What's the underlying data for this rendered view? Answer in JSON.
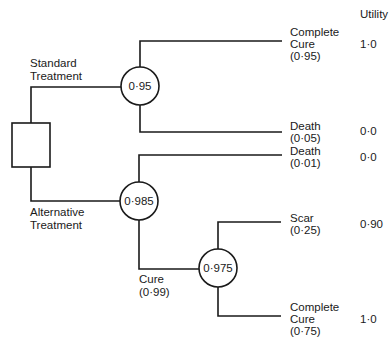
{
  "header": {
    "utility_label": "Utility"
  },
  "decision_node": {
    "label": ""
  },
  "branches": {
    "standard": {
      "line1": "Standard",
      "line2": "Treatment"
    },
    "alternative": {
      "line1": "Alternative",
      "line2": "Treatment"
    }
  },
  "chance_nodes": [
    {
      "id": "standard",
      "value": "0·95"
    },
    {
      "id": "alternative",
      "value": "0·985"
    },
    {
      "id": "cure",
      "value": "0·975"
    }
  ],
  "cure_branch": {
    "line1": "Cure",
    "line2": "(0·99)"
  },
  "outcomes": [
    {
      "lines": [
        "Complete",
        "Cure",
        "(0·95)"
      ],
      "utility": "1·0"
    },
    {
      "lines": [
        "Death",
        "(0·05)"
      ],
      "utility": "0·0"
    },
    {
      "lines": [
        "Death",
        "(0·01)"
      ],
      "utility": "0·0"
    },
    {
      "lines": [
        "Scar",
        "(0·25)"
      ],
      "utility": "0·90"
    },
    {
      "lines": [
        "Complete",
        "Cure",
        "(0·75)"
      ],
      "utility": "1·0"
    }
  ]
}
